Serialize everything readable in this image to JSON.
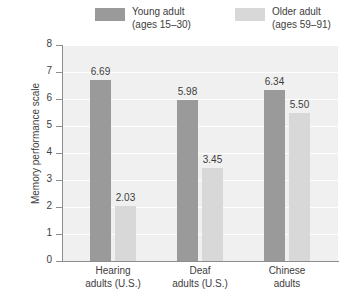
{
  "chart_data": {
    "type": "bar",
    "title": "",
    "xlabel": "",
    "ylabel": "Memory performance scale",
    "ylim": [
      0,
      8
    ],
    "yticks": [
      "0",
      "1",
      "2",
      "3",
      "4",
      "5",
      "6",
      "7",
      "8"
    ],
    "grid": true,
    "legend_position": "top",
    "categories": [
      "Hearing\nadults (U.S.)",
      "Deaf\nadults (U.S.)",
      "Chinese\nadults"
    ],
    "category_lines": [
      [
        "Hearing",
        "adults (U.S.)"
      ],
      [
        "Deaf",
        "adults (U.S.)"
      ],
      [
        "Chinese",
        "adults"
      ]
    ],
    "series": [
      {
        "name": "Young adult",
        "subtitle": "(ages 15–30)",
        "color": "#9a9a9a",
        "values": [
          6.69,
          5.98,
          6.34
        ],
        "labels": [
          "6.69",
          "5.98",
          "6.34"
        ]
      },
      {
        "name": "Older adult",
        "subtitle": "(ages 59–91)",
        "color": "#d8d8d8",
        "values": [
          2.03,
          3.45,
          5.5
        ],
        "labels": [
          "2.03",
          "3.45",
          "5.50"
        ]
      }
    ]
  },
  "legend": {
    "items": [
      {
        "name": "Young adult",
        "subtitle": "(ages 15–30)",
        "color": "#9a9a9a"
      },
      {
        "name": "Older adult",
        "subtitle": "(ages 59–91)",
        "color": "#d8d8d8"
      }
    ]
  },
  "axes": {
    "y_title": "Memory performance scale",
    "y_ticks": [
      "8",
      "7",
      "6",
      "5",
      "4",
      "3",
      "2",
      "1",
      "0"
    ]
  },
  "colors": {
    "young": "#9a9a9a",
    "older": "#d8d8d8",
    "plot_background": "#f0f0f0",
    "gridline": "#ffffff",
    "axis": "#8d8d8d",
    "text": "#3d3d3d"
  }
}
